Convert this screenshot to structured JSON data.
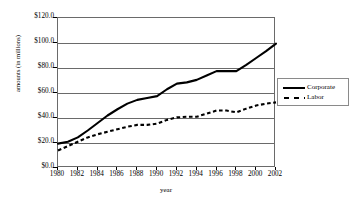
{
  "chart_data": {
    "type": "line",
    "title": "",
    "xlabel": "year",
    "ylabel": "amounts (in millions)",
    "xlim": [
      1980,
      2002
    ],
    "ylim": [
      0,
      120
    ],
    "grid": true,
    "legend_position": "right",
    "x": [
      1980,
      1981,
      1982,
      1983,
      1984,
      1985,
      1986,
      1987,
      1988,
      1989,
      1990,
      1991,
      1992,
      1993,
      1994,
      1995,
      1996,
      1997,
      1998,
      1999,
      2000,
      2001,
      2002
    ],
    "xtick_labels": [
      "1980",
      "1982",
      "1984",
      "1986",
      "1988",
      "1990",
      "1992",
      "1994",
      "1996",
      "1998",
      "2000",
      "2002"
    ],
    "xtick_values": [
      1980,
      1982,
      1984,
      1986,
      1988,
      1990,
      1992,
      1994,
      1996,
      1998,
      2000,
      2002
    ],
    "ytick_labels": [
      "$0.0",
      "$20.0",
      "$40.0",
      "$60.0",
      "$80.0",
      "$100.0",
      "$120.0"
    ],
    "ytick_values": [
      0,
      20,
      40,
      60,
      80,
      100,
      120
    ],
    "series": [
      {
        "name": "Corporate",
        "style": "solid",
        "color": "#000000",
        "values": [
          19.5,
          21.0,
          24.5,
          30.0,
          36.0,
          42.0,
          47.0,
          51.5,
          54.5,
          56.0,
          57.5,
          63.0,
          67.5,
          68.5,
          70.5,
          74.0,
          77.5,
          77.5,
          77.5,
          82.5,
          88.0,
          93.5,
          99.5
        ]
      },
      {
        "name": "Labor",
        "style": "dashed",
        "color": "#000000",
        "values": [
          14.0,
          17.5,
          21.0,
          24.5,
          27.0,
          29.0,
          31.0,
          33.0,
          34.5,
          34.5,
          35.5,
          38.5,
          40.5,
          41.0,
          41.0,
          43.5,
          46.0,
          46.0,
          44.5,
          47.5,
          50.0,
          51.5,
          52.5
        ]
      }
    ]
  },
  "legend": {
    "entries": [
      {
        "label": "Corporate"
      },
      {
        "label": "Labor"
      }
    ]
  }
}
